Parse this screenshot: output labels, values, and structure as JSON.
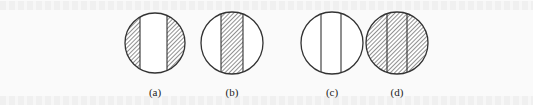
{
  "figure": {
    "stroke_color": "#333333",
    "fill_color": "#ffffff",
    "hatch_color": "#555555",
    "panels": [
      {
        "id": "a",
        "label": "(a)",
        "cx": 155,
        "cy": 43,
        "r": 30,
        "band_x1": 140,
        "band_x2": 167,
        "pattern": "hatched-sides-white-center"
      },
      {
        "id": "b",
        "label": "(b)",
        "cx": 232,
        "cy": 43,
        "r": 31,
        "band_x1": 221,
        "band_x2": 243,
        "pattern": "white-sides-hatched-center"
      },
      {
        "id": "c",
        "label": "(c)",
        "cx": 332,
        "cy": 43,
        "r": 31,
        "band_x1": 321,
        "band_x2": 341,
        "pattern": "all-white-two-lines"
      },
      {
        "id": "d",
        "label": "(d)",
        "cx": 397,
        "cy": 43,
        "r": 31,
        "band_x1": 387,
        "band_x2": 407,
        "pattern": "all-hatched-two-lines"
      }
    ]
  }
}
